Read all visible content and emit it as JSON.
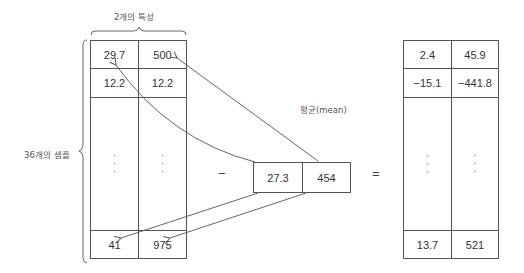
{
  "labels": {
    "features": "2개의 특성",
    "samples": "36개의 샘플",
    "mean": "평균(mean)"
  },
  "operators": {
    "minus": "−",
    "equals": "="
  },
  "input_matrix": {
    "rows": [
      [
        "29.7",
        "500"
      ],
      [
        "12.2",
        "12.2"
      ],
      [
        "⋮",
        "⋮"
      ],
      [
        "41",
        "975"
      ]
    ]
  },
  "mean_vector": [
    "27.3",
    "454"
  ],
  "result_matrix": {
    "rows": [
      [
        "2.4",
        "45.9"
      ],
      [
        "−15.1",
        "−441.8"
      ],
      [
        "⋮",
        "⋮"
      ],
      [
        "13.7",
        "521"
      ]
    ]
  }
}
